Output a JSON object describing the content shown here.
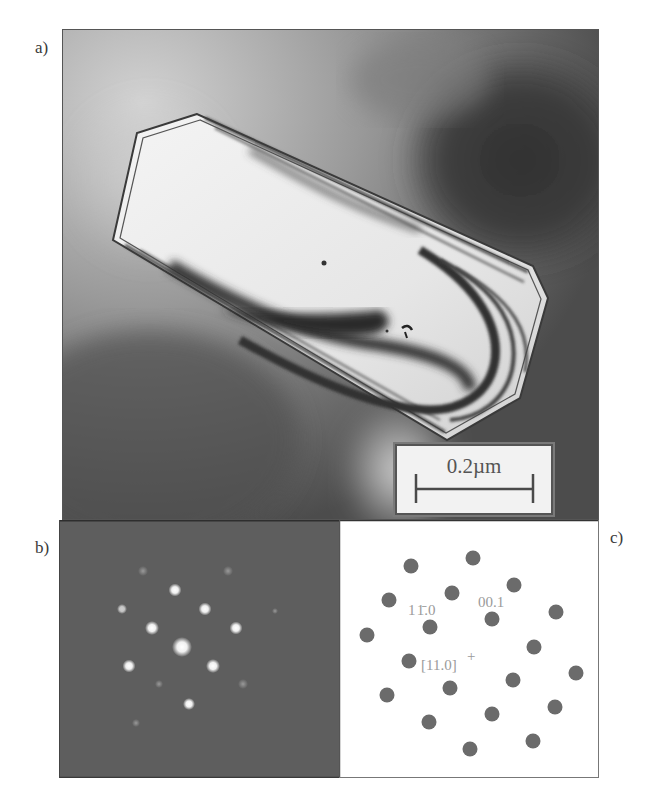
{
  "figure": {
    "panels": [
      {
        "id": "a",
        "label": "a)",
        "type": "tem-bright-field-micrograph",
        "scale_bar": {
          "text": "0.2µm"
        }
      },
      {
        "id": "b",
        "label": "b)",
        "type": "electron-diffraction-pattern"
      },
      {
        "id": "c",
        "label": "c)",
        "type": "indexed-diffraction-schematic",
        "annotations": {
          "spot_1": "11̄0",
          "spot_1_display": "1 1̄.0",
          "spot_2": "00.1",
          "zone_axis": "[11.0]",
          "zone_axis_marker": "+"
        }
      }
    ],
    "colors": {
      "frame": "#555555",
      "spot_schematic": "#6b6b6b",
      "schematic_text": "#9a9a9a",
      "diffraction_bg": "#5e5e5e",
      "scale_bar": "#4a4a4a"
    }
  }
}
